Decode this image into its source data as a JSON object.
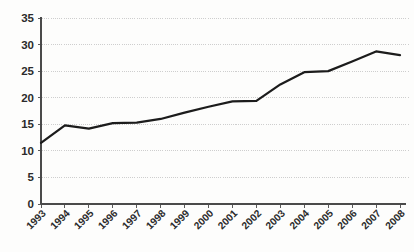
{
  "chart_data": {
    "type": "line",
    "title": "",
    "xlabel": "",
    "ylabel": "",
    "categories": [
      "1993",
      "1994",
      "1995",
      "1996",
      "1997",
      "1998",
      "1999",
      "2000",
      "2001",
      "2002",
      "2003",
      "2004",
      "2005",
      "2006",
      "2007",
      "2008"
    ],
    "values": [
      11.5,
      14.8,
      14.2,
      15.2,
      15.3,
      16.0,
      17.2,
      18.3,
      19.3,
      19.4,
      22.5,
      24.8,
      25.0,
      26.8,
      28.7,
      28.0
    ],
    "series": [
      {
        "name": "",
        "values": [
          11.5,
          14.8,
          14.2,
          15.2,
          15.3,
          16.0,
          17.2,
          18.3,
          19.3,
          19.4,
          22.5,
          24.8,
          25.0,
          26.8,
          28.7,
          28.0
        ]
      }
    ],
    "ylim": [
      0,
      35
    ],
    "yticks": [
      0,
      5,
      10,
      15,
      20,
      25,
      30,
      35
    ],
    "ytick_labels": [
      "0",
      "5",
      "10",
      "15",
      "20",
      "25",
      "30",
      "35"
    ],
    "xtick_labels": [
      "1993",
      "1994",
      "1995",
      "1996",
      "1997",
      "1998",
      "1999",
      "2000",
      "2001",
      "2002",
      "2003",
      "2004",
      "2005",
      "2006",
      "2007",
      "2008"
    ],
    "grid": true,
    "grid_axis": "y",
    "grid_style": "dotted",
    "legend": false,
    "legend_position": "none",
    "line_color": "#1c1c1c",
    "grid_color": "#c9c9c9",
    "axis_color": "#4a4a4a",
    "background_color": "#fdfdfc",
    "xtick_label_rotation": 45,
    "annotations": []
  },
  "caption": {
    "text": ""
  }
}
